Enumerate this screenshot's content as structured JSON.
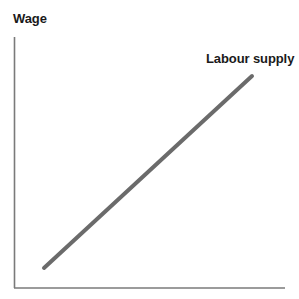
{
  "figure": {
    "background_color": "#ffffff",
    "width": 299,
    "height": 299
  },
  "labels": {
    "y_axis": "Wage",
    "x_axis": "",
    "series": "Labour supply"
  },
  "style": {
    "axis_color": "#7a7a7a",
    "curve_color": "#6b6b6b",
    "text_color": "#1a1a1a",
    "axis_width_px": 1.6,
    "curve_width_px": 4
  },
  "chart_data": {
    "type": "line",
    "title": "",
    "xlabel": "",
    "ylabel": "Wage",
    "grid": false,
    "legend_position": "inline-end-of-line",
    "axes": {
      "x_start_px": 14,
      "x_end_px": 285,
      "y_top_px": 37,
      "y_bottom_px": 288,
      "ticks": [],
      "tick_labels": []
    },
    "series": [
      {
        "name": "Labour supply",
        "color": "#6b6b6b",
        "x": [
          0.11,
          0.88
        ],
        "y": [
          0.08,
          0.85
        ],
        "points_px": [
          {
            "x": 44,
            "y": 268
          },
          {
            "x": 252,
            "y": 76
          }
        ],
        "slope": "positive",
        "annotation": "Labour supply"
      }
    ]
  }
}
